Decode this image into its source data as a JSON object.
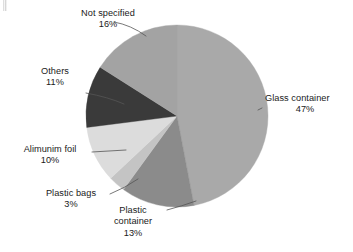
{
  "chart_data": {
    "type": "pie",
    "title": "",
    "subtitle": "",
    "xlabel": "",
    "ylabel": "",
    "legend_position": "none",
    "grid": false,
    "units": "percent",
    "total": 100,
    "categories": [
      "Glass container",
      "Plastic container",
      "Plastic bags",
      "Alimunim foil",
      "Others",
      "Not specified"
    ],
    "values": [
      47,
      13,
      3,
      10,
      11,
      16
    ],
    "slices": [
      {
        "label": "Glass container",
        "value": 47,
        "value_text": "47%",
        "color": "#a9a9a9",
        "start_angle": 0,
        "end_angle": 169.2,
        "label_lines": [
          "Glass container",
          "47%"
        ]
      },
      {
        "label": "Plastic container",
        "value": 13,
        "value_text": "13%",
        "color": "#8b8b8b",
        "start_angle": 169.2,
        "end_angle": 216.0,
        "label_lines": [
          "Plastic",
          "container",
          "13%"
        ]
      },
      {
        "label": "Plastic bags",
        "value": 3,
        "value_text": "3%",
        "color": "#c4c4c4",
        "start_angle": 216.0,
        "end_angle": 226.8,
        "label_lines": [
          "Plastic bags",
          "3%"
        ]
      },
      {
        "label": "Alimunim foil",
        "value": 10,
        "value_text": "10%",
        "color": "#dcdcdc",
        "start_angle": 226.8,
        "end_angle": 262.8,
        "label_lines": [
          "Alimunim foil",
          "10%"
        ]
      },
      {
        "label": "Others",
        "value": 11,
        "value_text": "11%",
        "color": "#3a3a3a",
        "start_angle": 262.8,
        "end_angle": 302.4,
        "label_lines": [
          "Others",
          "11%"
        ]
      },
      {
        "label": "Not specified",
        "value": 16,
        "value_text": "16%",
        "color": "#a3a3a3",
        "start_angle": 302.4,
        "end_angle": 360.0,
        "label_lines": [
          "Not specified",
          "16%"
        ]
      }
    ]
  },
  "labels": {
    "glass": {
      "name": "Glass container",
      "value": "47%"
    },
    "plastic_container": {
      "name_line1": "Plastic",
      "name_line2": "container",
      "value": "13%"
    },
    "plastic_bags": {
      "name": "Plastic bags",
      "value": "3%"
    },
    "foil": {
      "name": "Alimunim foil",
      "value": "10%"
    },
    "others": {
      "name": "Others",
      "value": "11%"
    },
    "not_specified": {
      "name": "Not specified",
      "value": "16%"
    }
  },
  "colors": {
    "background": "#ffffff",
    "text": "#1a1a1a",
    "leader_line": "#555555",
    "slice_glass": "#a9a9a9",
    "slice_plastic_container": "#8b8b8b",
    "slice_plastic_bags": "#c4c4c4",
    "slice_foil": "#dcdcdc",
    "slice_others": "#3a3a3a",
    "slice_not_specified": "#a3a3a3"
  }
}
